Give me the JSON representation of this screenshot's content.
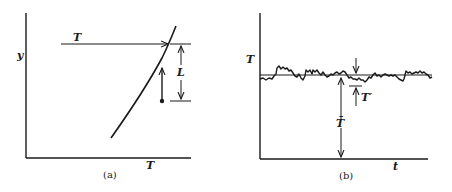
{
  "panel_a": {
    "caption": "(a)",
    "y_axis_label": "y",
    "x_axis_label": "T",
    "arrow_label": "T",
    "bracket_label": "L"
  },
  "panel_b": {
    "caption": "(b)",
    "y_axis_label": "T",
    "x_axis_label": "t",
    "mean_label": "T̄",
    "fluctuation_label": "T′"
  },
  "colors": {
    "ink": "#1a1a1a",
    "background": "#ffffff"
  }
}
